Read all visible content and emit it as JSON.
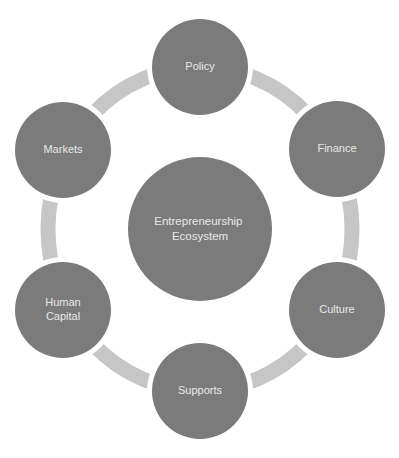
{
  "diagram": {
    "type": "cycle",
    "center": {
      "label_lines": [
        "Entrepreneurship",
        "Ecosystem"
      ]
    },
    "nodes": [
      {
        "id": "policy",
        "label_lines": [
          "Policy"
        ]
      },
      {
        "id": "finance",
        "label_lines": [
          "Finance"
        ]
      },
      {
        "id": "culture",
        "label_lines": [
          "Culture"
        ]
      },
      {
        "id": "supports",
        "label_lines": [
          "Supports"
        ]
      },
      {
        "id": "human-capital",
        "label_lines": [
          "Human",
          "Capital"
        ]
      },
      {
        "id": "markets",
        "label_lines": [
          "Markets"
        ]
      }
    ],
    "colors": {
      "node_fill": "#7b7b7b",
      "ring": "#c6c6c6",
      "text": "#e8e8e8",
      "background": "#ffffff"
    }
  }
}
